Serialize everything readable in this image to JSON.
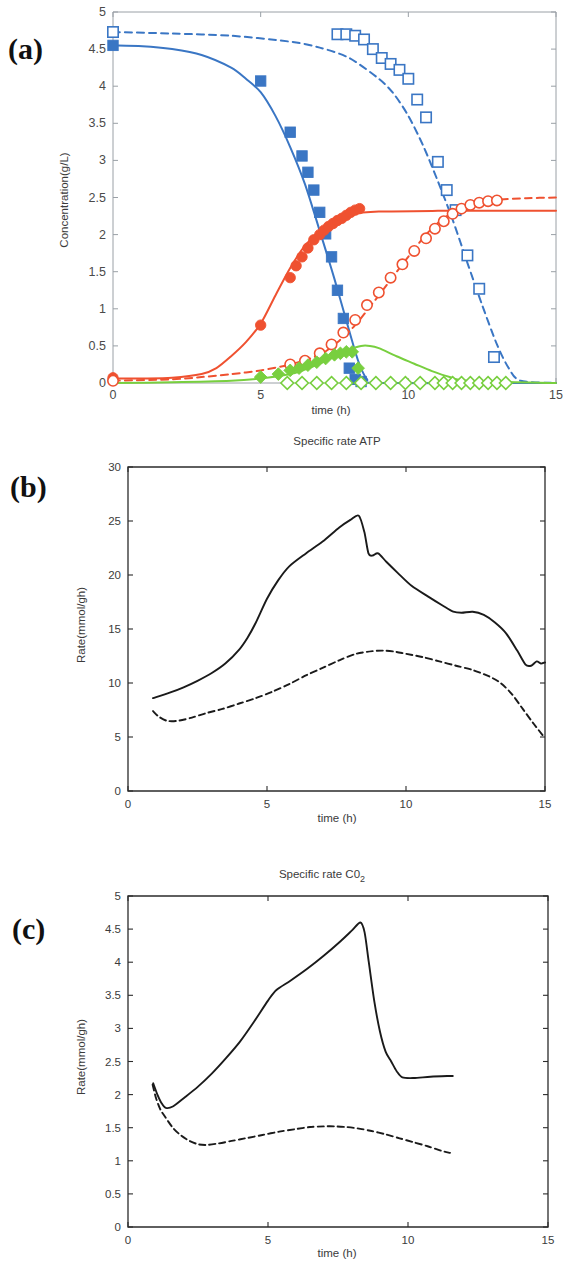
{
  "figure": {
    "panels": [
      "a",
      "b",
      "c"
    ],
    "labels": {
      "a": "(a)",
      "b": "(b)",
      "c": "(c)"
    }
  },
  "panel_a": {
    "label": "(a)",
    "title": "",
    "xlabel": "time (h)",
    "ylabel": "Concentration(g/L)",
    "xticks": [
      "0",
      "5",
      "10",
      "15"
    ],
    "yticks": [
      "0",
      "0.5",
      "1",
      "1.5",
      "2",
      "2.5",
      "3",
      "3.5",
      "4",
      "4.5",
      "5"
    ],
    "colors": {
      "blue": "#3a76c4",
      "red": "#ef5130",
      "green": "#78cf3f"
    }
  },
  "panel_b": {
    "label": "(b)",
    "title": "Specific rate ATP",
    "xlabel": "time (h)",
    "ylabel": "Rate(mmol/gh)",
    "xticks": [
      "0",
      "5",
      "10",
      "15"
    ],
    "yticks": [
      "0",
      "5",
      "10",
      "15",
      "20",
      "25",
      "30"
    ],
    "colors": {
      "line": "#1a1a1a"
    }
  },
  "panel_c": {
    "label": "(c)",
    "title_main": "Specific rate C0",
    "title_sub": "2",
    "title": "Specific rate C02",
    "xlabel": "time (h)",
    "ylabel": "Rate(mmol/gh)",
    "xticks": [
      "0",
      "5",
      "10",
      "15"
    ],
    "yticks": [
      "0",
      "0.5",
      "1",
      "1.5",
      "2",
      "2.5",
      "3",
      "3.5",
      "4",
      "4.5",
      "5"
    ],
    "colors": {
      "line": "#1a1a1a"
    }
  },
  "chart_data": [
    {
      "panel": "a",
      "type": "line",
      "title": "",
      "xlabel": "time (h)",
      "ylabel": "Concentration(g/L)",
      "xlim": [
        0,
        15
      ],
      "ylim": [
        0,
        5
      ],
      "xticks": [
        0,
        5,
        10,
        15
      ],
      "yticks": [
        0,
        0.5,
        1,
        1.5,
        2,
        2.5,
        3,
        3.5,
        4,
        4.5,
        5
      ],
      "grid": false,
      "legend": "none",
      "series": [
        {
          "name": "Glucose batch 1 (model)",
          "style": "solid",
          "color": "#3a76c4",
          "x": [
            0,
            1,
            2,
            3,
            4,
            4.5,
            5,
            5.5,
            6,
            6.5,
            7,
            7.5,
            8,
            8.3,
            8.6,
            9,
            15
          ],
          "y": [
            4.55,
            4.54,
            4.5,
            4.42,
            4.25,
            4.1,
            3.92,
            3.6,
            3.18,
            2.68,
            2.05,
            1.4,
            0.7,
            0.3,
            0.05,
            0.0,
            0.0
          ]
        },
        {
          "name": "Glucose batch 1 (data, filled square)",
          "style": "marker",
          "marker": "filled-square",
          "color": "#3a76c4",
          "x": [
            0,
            5,
            6,
            6.4,
            6.6,
            6.8,
            7.0,
            7.2,
            7.4,
            7.6,
            7.8,
            8.0,
            8.2,
            8.4
          ],
          "y": [
            4.55,
            4.07,
            3.38,
            3.06,
            2.84,
            2.6,
            2.3,
            2.01,
            1.7,
            1.25,
            0.87,
            0.2,
            0.05,
            0.02
          ]
        },
        {
          "name": "Glucose batch 2 (model)",
          "style": "dashed",
          "color": "#3a76c4",
          "x": [
            0,
            2,
            4,
            6,
            7,
            8,
            9,
            9.5,
            10,
            10.5,
            11,
            11.5,
            12,
            12.5,
            13,
            13.4,
            13.8,
            15
          ],
          "y": [
            4.73,
            4.71,
            4.68,
            4.6,
            4.52,
            4.38,
            4.1,
            3.9,
            3.6,
            3.2,
            2.72,
            2.2,
            1.62,
            1.05,
            0.52,
            0.2,
            0.03,
            0.0
          ]
        },
        {
          "name": "Glucose batch 2 (data, open square)",
          "style": "marker",
          "marker": "open-square",
          "color": "#3a76c4",
          "x": [
            0,
            7.6,
            7.9,
            8.2,
            8.5,
            8.8,
            9.1,
            9.4,
            9.7,
            10.0,
            10.3,
            10.6,
            11.0,
            11.3,
            11.6,
            12.0,
            12.4,
            12.9
          ],
          "y": [
            4.73,
            4.7,
            4.7,
            4.68,
            4.63,
            4.5,
            4.38,
            4.3,
            4.22,
            4.1,
            3.82,
            3.58,
            2.98,
            2.6,
            2.33,
            1.72,
            1.27,
            0.35
          ]
        },
        {
          "name": "Ethanol batch 1 (model)",
          "style": "solid",
          "color": "#ef5130",
          "x": [
            0,
            1,
            2,
            3,
            3.5,
            4,
            4.5,
            5,
            5.5,
            6,
            6.5,
            7,
            7.5,
            8,
            9,
            11,
            13,
            15
          ],
          "y": [
            0.06,
            0.06,
            0.07,
            0.12,
            0.2,
            0.36,
            0.55,
            0.8,
            1.18,
            1.55,
            1.85,
            2.05,
            2.2,
            2.27,
            2.31,
            2.32,
            2.32,
            2.32
          ]
        },
        {
          "name": "Ethanol batch 1 (data, filled circle)",
          "style": "marker",
          "marker": "filled-circle",
          "color": "#ef5130",
          "x": [
            0,
            5,
            6,
            6.2,
            6.4,
            6.6,
            6.8,
            7.0,
            7.15,
            7.3,
            7.45,
            7.6,
            7.75,
            7.9,
            8.05,
            8.2,
            8.35
          ],
          "y": [
            0.07,
            0.78,
            1.42,
            1.58,
            1.7,
            1.82,
            1.93,
            2.0,
            2.06,
            2.11,
            2.15,
            2.19,
            2.22,
            2.26,
            2.3,
            2.33,
            2.35
          ]
        },
        {
          "name": "Ethanol batch 2 (model)",
          "style": "dashed",
          "color": "#ef5130",
          "x": [
            0,
            2,
            3,
            4,
            5,
            6,
            7,
            7.6,
            8.2,
            9,
            9.8,
            10.6,
            11.2,
            11.8,
            12.4,
            13,
            14,
            15
          ],
          "y": [
            0.03,
            0.05,
            0.08,
            0.12,
            0.17,
            0.25,
            0.38,
            0.55,
            0.78,
            1.18,
            1.6,
            2.0,
            2.22,
            2.36,
            2.44,
            2.47,
            2.49,
            2.5
          ]
        },
        {
          "name": "Ethanol batch 2 (data, open circle)",
          "style": "marker",
          "marker": "open-circle",
          "color": "#ef5130",
          "x": [
            0,
            6.0,
            6.5,
            7.0,
            7.4,
            7.8,
            8.2,
            8.6,
            9.0,
            9.4,
            9.8,
            10.2,
            10.6,
            10.9,
            11.2,
            11.5,
            11.8,
            12.1,
            12.4,
            12.7,
            13.0
          ],
          "y": [
            0.03,
            0.25,
            0.3,
            0.4,
            0.52,
            0.68,
            0.85,
            1.05,
            1.22,
            1.42,
            1.6,
            1.78,
            1.95,
            2.08,
            2.18,
            2.28,
            2.35,
            2.4,
            2.43,
            2.45,
            2.46
          ]
        },
        {
          "name": "Glycerol batch 1 (model)",
          "style": "solid",
          "color": "#78cf3f",
          "x": [
            0,
            2,
            4,
            5,
            6,
            6.5,
            7,
            7.5,
            8,
            8.4,
            8.7,
            9,
            9.6,
            10.2,
            10.8,
            11.4,
            12,
            15
          ],
          "y": [
            0.0,
            0.01,
            0.03,
            0.06,
            0.12,
            0.18,
            0.26,
            0.36,
            0.45,
            0.5,
            0.5,
            0.47,
            0.36,
            0.26,
            0.16,
            0.08,
            0.03,
            0.0
          ]
        },
        {
          "name": "Glycerol batch 1 (data, filled diamond)",
          "style": "marker",
          "marker": "filled-diamond",
          "color": "#78cf3f",
          "x": [
            5.0,
            5.6,
            6.0,
            6.3,
            6.6,
            6.9,
            7.2,
            7.5,
            7.7,
            7.9,
            8.1,
            8.3
          ],
          "y": [
            0.08,
            0.12,
            0.17,
            0.2,
            0.24,
            0.28,
            0.33,
            0.38,
            0.4,
            0.42,
            0.42,
            0.2
          ]
        },
        {
          "name": "Glycerol batch 2 (data, open diamond)",
          "style": "marker",
          "marker": "open-diamond",
          "color": "#78cf3f",
          "x": [
            5.9,
            6.4,
            6.9,
            7.4,
            7.9,
            8.4,
            8.9,
            9.4,
            9.9,
            10.4,
            10.9,
            11.2,
            11.5,
            11.8,
            12.1,
            12.4,
            12.7,
            13.0,
            13.3
          ],
          "y": [
            0.0,
            0.0,
            0.0,
            0.0,
            0.0,
            0.0,
            0.0,
            0.0,
            0.0,
            0.0,
            0.0,
            0.0,
            0.0,
            0.0,
            0.0,
            0.0,
            0.0,
            0.0,
            0.0
          ]
        }
      ]
    },
    {
      "panel": "b",
      "type": "line",
      "title": "Specific rate ATP",
      "xlabel": "time (h)",
      "ylabel": "Rate(mmol/gh)",
      "xlim": [
        0,
        15
      ],
      "ylim": [
        0,
        30
      ],
      "xticks": [
        0,
        5,
        10,
        15
      ],
      "yticks": [
        0,
        5,
        10,
        15,
        20,
        25,
        30
      ],
      "grid": false,
      "legend": "none",
      "series": [
        {
          "name": "Batch 1 (solid)",
          "style": "solid",
          "color": "#1a1a1a",
          "x": [
            0.9,
            1.5,
            2.0,
            2.5,
            3.0,
            3.5,
            4.0,
            4.3,
            4.6,
            5.0,
            5.4,
            5.8,
            6.4,
            7.0,
            7.6,
            8.0,
            8.3,
            8.5,
            8.65,
            8.8,
            9.0,
            9.3,
            9.7,
            10.2,
            10.8,
            11.3,
            11.7,
            12.0,
            12.4,
            12.8,
            13.2,
            13.6,
            14.0,
            14.3,
            14.5,
            14.7,
            14.85,
            15.0
          ],
          "y": [
            8.6,
            9.1,
            9.6,
            10.2,
            10.9,
            11.8,
            13.1,
            14.2,
            15.6,
            17.8,
            19.5,
            20.8,
            22.0,
            23.1,
            24.4,
            25.1,
            25.5,
            24.0,
            22.0,
            21.8,
            22.0,
            21.2,
            20.2,
            19.0,
            18.0,
            17.2,
            16.6,
            16.5,
            16.6,
            16.3,
            15.6,
            14.6,
            13.0,
            11.7,
            11.6,
            12.0,
            11.8,
            11.9
          ]
        },
        {
          "name": "Batch 2 (dashed)",
          "style": "dashed",
          "color": "#1a1a1a",
          "x": [
            0.9,
            1.1,
            1.4,
            1.8,
            2.3,
            2.8,
            3.4,
            4.0,
            4.6,
            5.2,
            5.8,
            6.4,
            7.0,
            7.6,
            8.2,
            8.8,
            9.2,
            9.6,
            10.0,
            10.6,
            11.2,
            11.8,
            12.4,
            13.0,
            13.4,
            13.8,
            14.2,
            14.6,
            15.0
          ],
          "y": [
            7.4,
            6.9,
            6.5,
            6.5,
            6.8,
            7.2,
            7.6,
            8.1,
            8.6,
            9.2,
            9.9,
            10.7,
            11.4,
            12.1,
            12.7,
            12.95,
            13.0,
            12.9,
            12.7,
            12.4,
            12.0,
            11.6,
            11.2,
            10.6,
            10.0,
            9.0,
            7.6,
            6.2,
            4.9
          ]
        }
      ]
    },
    {
      "panel": "c",
      "type": "line",
      "title": "Specific rate C02",
      "xlabel": "time (h)",
      "ylabel": "Rate(mmol/gh)",
      "xlim": [
        0,
        15
      ],
      "ylim": [
        0,
        5
      ],
      "xticks": [
        0,
        5,
        10,
        15
      ],
      "yticks": [
        0,
        0.5,
        1,
        1.5,
        2,
        2.5,
        3,
        3.5,
        4,
        4.5,
        5
      ],
      "grid": false,
      "legend": "none",
      "series": [
        {
          "name": "Batch 1 (solid)",
          "style": "solid",
          "color": "#1a1a1a",
          "x": [
            0.9,
            1.05,
            1.2,
            1.35,
            1.6,
            2.0,
            2.5,
            3.0,
            3.5,
            4.0,
            4.5,
            5.0,
            5.3,
            5.8,
            6.4,
            7.0,
            7.6,
            8.0,
            8.3,
            8.45,
            8.6,
            8.8,
            9.0,
            9.2,
            9.4,
            9.6,
            9.8,
            10.2,
            10.8,
            11.4,
            11.6
          ],
          "y": [
            2.17,
            2.0,
            1.87,
            1.8,
            1.82,
            1.95,
            2.12,
            2.32,
            2.55,
            2.8,
            3.1,
            3.42,
            3.58,
            3.72,
            3.9,
            4.1,
            4.32,
            4.48,
            4.6,
            4.45,
            4.0,
            3.4,
            2.95,
            2.65,
            2.5,
            2.35,
            2.26,
            2.25,
            2.27,
            2.28,
            2.28
          ]
        },
        {
          "name": "Batch 2 (dashed)",
          "style": "dashed",
          "color": "#1a1a1a",
          "x": [
            0.88,
            1.0,
            1.15,
            1.3,
            1.6,
            1.9,
            2.2,
            2.5,
            2.8,
            3.2,
            3.7,
            4.2,
            4.8,
            5.4,
            6.0,
            6.5,
            7.0,
            7.4,
            7.8,
            8.2,
            8.7,
            9.2,
            9.7,
            10.2,
            10.7,
            11.2,
            11.5
          ],
          "y": [
            2.15,
            1.95,
            1.78,
            1.68,
            1.5,
            1.38,
            1.3,
            1.25,
            1.24,
            1.26,
            1.3,
            1.34,
            1.39,
            1.44,
            1.48,
            1.51,
            1.52,
            1.52,
            1.51,
            1.49,
            1.45,
            1.4,
            1.34,
            1.28,
            1.22,
            1.15,
            1.12
          ]
        }
      ]
    }
  ]
}
